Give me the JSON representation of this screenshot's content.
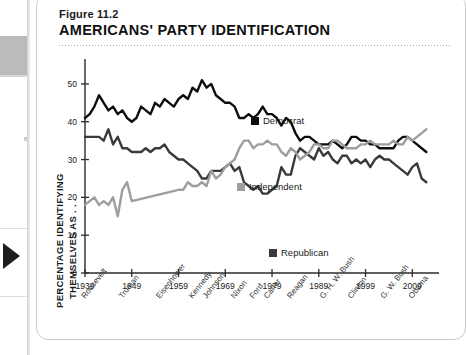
{
  "sidebar": {
    "text_fragment_1": "e",
    "text_fragment_2": "·",
    "arrow_icon": "next-arrow-icon"
  },
  "figure": {
    "label": "Figure 11.2",
    "title": "AMERICANS' PARTY IDENTIFICATION"
  },
  "axis_title": {
    "line1": "PERCENTAGE IDENTIFYING",
    "line2": "THEMSELVES AS . . ."
  },
  "colors": {
    "democrat": "#0d0d0d",
    "republican": "#3a3a3a",
    "independent": "#9e9e9e",
    "axis": "#2b2b2b",
    "card_border": "#c9c9c9"
  },
  "chart_data": {
    "type": "line",
    "title": "AMERICANS' PARTY IDENTIFICATION",
    "xlabel": "",
    "ylabel": "PERCENTAGE IDENTIFYING THEMSELVES AS . . .",
    "xlim": [
      1939,
      2013
    ],
    "ylim": [
      0,
      55
    ],
    "yticks": [
      0,
      10,
      20,
      30,
      40,
      50
    ],
    "xticks": [
      1939,
      1949,
      1959,
      1969,
      1979,
      1989,
      1999,
      2009
    ],
    "grid": false,
    "legend_position": "inside-plot",
    "presidents": [
      {
        "name": "Roosevelt",
        "x": 1939
      },
      {
        "name": "Truman",
        "x": 1947
      },
      {
        "name": "Eisenhower",
        "x": 1955
      },
      {
        "name": "Kennedy",
        "x": 1962
      },
      {
        "name": "Johnson",
        "x": 1965
      },
      {
        "name": "Nixon",
        "x": 1971
      },
      {
        "name": "Ford",
        "x": 1975
      },
      {
        "name": "Carter",
        "x": 1978
      },
      {
        "name": "Reagan",
        "x": 1983
      },
      {
        "name": "G. H. W. Bush",
        "x": 1990
      },
      {
        "name": "Clinton",
        "x": 1996
      },
      {
        "name": "G. W. Bush",
        "x": 2003
      },
      {
        "name": "Obama",
        "x": 2009
      }
    ],
    "series": [
      {
        "name": "Democrat",
        "color": "#0d0d0d",
        "x": [
          1939,
          1940,
          1941,
          1942,
          1943,
          1944,
          1945,
          1946,
          1947,
          1948,
          1949,
          1950,
          1951,
          1952,
          1953,
          1954,
          1955,
          1956,
          1957,
          1958,
          1959,
          1960,
          1961,
          1962,
          1963,
          1964,
          1965,
          1966,
          1967,
          1968,
          1969,
          1970,
          1971,
          1972,
          1973,
          1974,
          1975,
          1976,
          1977,
          1978,
          1979,
          1980,
          1981,
          1982,
          1983,
          1984,
          1985,
          1986,
          1987,
          1988,
          1989,
          1990,
          1991,
          1992,
          1993,
          1994,
          1995,
          1996,
          1997,
          1998,
          1999,
          2000,
          2001,
          2002,
          2003,
          2004,
          2005,
          2006,
          2007,
          2008,
          2009,
          2010,
          2011,
          2012
        ],
        "values": [
          41,
          42,
          44,
          47,
          45,
          43,
          44,
          42,
          43,
          41,
          40,
          41,
          44,
          43,
          42,
          45,
          44,
          46,
          45,
          44,
          46,
          47,
          46,
          49,
          48,
          51,
          49,
          50,
          47,
          46,
          45,
          45,
          44,
          41,
          41,
          42,
          41,
          42,
          44,
          42,
          42,
          41,
          39,
          41,
          40,
          37,
          35,
          36,
          36,
          35,
          34,
          34,
          34,
          35,
          34,
          33,
          34,
          36,
          36,
          35,
          35,
          34,
          34,
          33,
          33,
          33,
          33,
          35,
          36,
          36,
          35,
          34,
          33,
          32
        ]
      },
      {
        "name": "Republican",
        "color": "#3a3a3a",
        "x": [
          1939,
          1940,
          1941,
          1942,
          1943,
          1944,
          1945,
          1946,
          1947,
          1948,
          1949,
          1950,
          1951,
          1952,
          1953,
          1954,
          1955,
          1956,
          1957,
          1958,
          1959,
          1960,
          1961,
          1962,
          1963,
          1964,
          1965,
          1966,
          1967,
          1968,
          1969,
          1970,
          1971,
          1972,
          1973,
          1974,
          1975,
          1976,
          1977,
          1978,
          1979,
          1980,
          1981,
          1982,
          1983,
          1984,
          1985,
          1986,
          1987,
          1988,
          1989,
          1990,
          1991,
          1992,
          1993,
          1994,
          1995,
          1996,
          1997,
          1998,
          1999,
          2000,
          2001,
          2002,
          2003,
          2004,
          2005,
          2006,
          2007,
          2008,
          2009,
          2010,
          2011,
          2012
        ],
        "values": [
          36,
          36,
          36,
          36,
          35,
          38,
          34,
          36,
          33,
          33,
          32,
          32,
          32,
          33,
          32,
          33,
          33,
          34,
          32,
          31,
          30,
          30,
          29,
          28,
          27,
          25,
          25,
          27,
          27,
          27,
          28,
          29,
          27,
          28,
          24,
          23,
          22,
          23,
          21,
          21,
          22,
          23,
          28,
          26,
          26,
          31,
          33,
          32,
          31,
          30,
          33,
          31,
          32,
          30,
          29,
          31,
          31,
          29,
          30,
          29,
          30,
          28,
          30,
          31,
          30,
          30,
          29,
          28,
          27,
          26,
          28,
          29,
          25,
          24
        ]
      },
      {
        "name": "Independent",
        "color": "#9e9e9e",
        "x": [
          1939,
          1940,
          1941,
          1942,
          1943,
          1944,
          1945,
          1946,
          1947,
          1948,
          1949,
          1959,
          1960,
          1961,
          1962,
          1963,
          1964,
          1965,
          1966,
          1967,
          1968,
          1969,
          1970,
          1971,
          1972,
          1973,
          1974,
          1975,
          1976,
          1977,
          1978,
          1979,
          1980,
          1981,
          1982,
          1983,
          1984,
          1985,
          1986,
          1987,
          1988,
          1989,
          1990,
          1991,
          1992,
          1993,
          1994,
          1995,
          1996,
          1997,
          1998,
          1999,
          2000,
          2001,
          2002,
          2003,
          2004,
          2005,
          2006,
          2007,
          2008,
          2009,
          2010,
          2011,
          2012
        ],
        "values": [
          18,
          19,
          20,
          18,
          19,
          18,
          20,
          15,
          22,
          24,
          19,
          22,
          22,
          24,
          23,
          23,
          24,
          23,
          27,
          25,
          26,
          28,
          29,
          30,
          33,
          35,
          35,
          33,
          34,
          34,
          35,
          34,
          34,
          32,
          31,
          33,
          32,
          30,
          31,
          32,
          34,
          34,
          33,
          33,
          35,
          35,
          34,
          33,
          33,
          33,
          34,
          34,
          35,
          34,
          34,
          34,
          34,
          35,
          34,
          34,
          36,
          35,
          36,
          37,
          38
        ]
      }
    ]
  }
}
